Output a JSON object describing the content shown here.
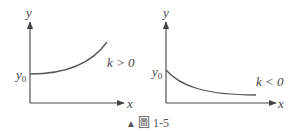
{
  "figure": {
    "caption_marker": "▲",
    "caption": "圖 1-5"
  },
  "left_panel": {
    "y_axis_label": "y",
    "x_axis_label": "x",
    "y0_label": "y",
    "y0_sub": "0",
    "condition": "k > 0"
  },
  "right_panel": {
    "y_axis_label": "y",
    "x_axis_label": "x",
    "y0_label": "y",
    "y0_sub": "0",
    "condition": "k < 0"
  },
  "colors": {
    "axis": "#444444",
    "curve": "#555555"
  }
}
